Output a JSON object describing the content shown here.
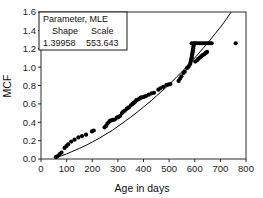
{
  "chart_data": {
    "type": "scatter",
    "title": "",
    "xlabel": "Age in days",
    "ylabel": "MCF",
    "xlim": [
      0,
      800
    ],
    "ylim": [
      0.0,
      1.6
    ],
    "xticks": [
      0,
      100,
      200,
      300,
      400,
      500,
      600,
      700,
      800
    ],
    "xtick_labels": [
      "0",
      "100",
      "200",
      "300",
      "400",
      "500",
      "600",
      "700",
      "800"
    ],
    "yticks": [
      0.0,
      0.2,
      0.4,
      0.6,
      0.8,
      1.0,
      1.2,
      1.4,
      1.6
    ],
    "ytick_labels": [
      "0.0",
      "0.2",
      "0.4",
      "0.6",
      "0.8",
      "1.0",
      "1.2",
      "1.4",
      "1.6"
    ],
    "grid": false,
    "legend_position": "upper-left",
    "marker_color": "#000000",
    "line_color": "#000000",
    "series": [
      {
        "name": "MCF data",
        "type": "scatter",
        "points": [
          [
            58,
            0.02
          ],
          [
            64,
            0.03
          ],
          [
            72,
            0.05
          ],
          [
            80,
            0.07
          ],
          [
            92,
            0.12
          ],
          [
            99,
            0.14
          ],
          [
            106,
            0.16
          ],
          [
            118,
            0.19
          ],
          [
            131,
            0.21
          ],
          [
            146,
            0.235
          ],
          [
            160,
            0.25
          ],
          [
            176,
            0.265
          ],
          [
            199,
            0.3
          ],
          [
            206,
            0.31
          ],
          [
            248,
            0.345
          ],
          [
            254,
            0.36
          ],
          [
            259,
            0.385
          ],
          [
            264,
            0.4
          ],
          [
            269,
            0.415
          ],
          [
            274,
            0.42
          ],
          [
            281,
            0.425
          ],
          [
            288,
            0.43
          ],
          [
            296,
            0.45
          ],
          [
            302,
            0.455
          ],
          [
            309,
            0.47
          ],
          [
            316,
            0.5
          ],
          [
            321,
            0.515
          ],
          [
            327,
            0.525
          ],
          [
            334,
            0.545
          ],
          [
            339,
            0.555
          ],
          [
            345,
            0.565
          ],
          [
            351,
            0.585
          ],
          [
            357,
            0.6
          ],
          [
            362,
            0.61
          ],
          [
            368,
            0.625
          ],
          [
            372,
            0.64
          ],
          [
            377,
            0.645
          ],
          [
            383,
            0.655
          ],
          [
            388,
            0.665
          ],
          [
            393,
            0.67
          ],
          [
            399,
            0.675
          ],
          [
            404,
            0.68
          ],
          [
            410,
            0.685
          ],
          [
            421,
            0.7
          ],
          [
            432,
            0.715
          ],
          [
            441,
            0.72
          ],
          [
            458,
            0.755
          ],
          [
            466,
            0.77
          ],
          [
            477,
            0.785
          ],
          [
            489,
            0.805
          ],
          [
            497,
            0.81
          ],
          [
            505,
            0.815
          ],
          [
            537,
            0.85
          ],
          [
            543,
            0.875
          ],
          [
            548,
            0.9
          ],
          [
            556,
            0.935
          ],
          [
            561,
            0.95
          ],
          [
            570,
            0.99
          ],
          [
            574,
            1.0
          ],
          [
            578,
            1.015
          ],
          [
            582,
            1.035
          ],
          [
            584,
            1.055
          ],
          [
            586,
            1.075
          ],
          [
            587,
            1.09
          ],
          [
            588,
            1.105
          ],
          [
            589,
            1.125
          ],
          [
            590,
            1.14
          ],
          [
            591,
            1.155
          ],
          [
            592,
            1.17
          ],
          [
            593,
            1.19
          ],
          [
            594,
            1.205
          ],
          [
            595,
            1.225
          ],
          [
            596,
            1.245
          ],
          [
            598,
            1.26
          ],
          [
            588,
            1.26
          ],
          [
            597,
            1.26
          ],
          [
            604,
            1.26
          ],
          [
            611,
            1.26
          ],
          [
            618,
            1.26
          ],
          [
            625,
            1.26
          ],
          [
            632,
            1.26
          ],
          [
            639,
            1.26
          ],
          [
            646,
            1.26
          ],
          [
            653,
            1.26
          ],
          [
            660,
            1.26
          ],
          [
            666,
            1.26
          ],
          [
            602,
            1.06
          ],
          [
            609,
            1.075
          ],
          [
            614,
            1.09
          ],
          [
            620,
            1.105
          ],
          [
            626,
            1.12
          ],
          [
            631,
            1.13
          ],
          [
            637,
            1.14
          ],
          [
            643,
            1.155
          ],
          [
            648,
            1.165
          ],
          [
            760,
            1.26
          ]
        ]
      },
      {
        "name": "MLE fitted Weibull curve",
        "type": "line",
        "points": [
          [
            58,
            0.02
          ],
          [
            80,
            0.035
          ],
          [
            100,
            0.055
          ],
          [
            120,
            0.08
          ],
          [
            150,
            0.115
          ],
          [
            180,
            0.155
          ],
          [
            200,
            0.185
          ],
          [
            230,
            0.23
          ],
          [
            250,
            0.265
          ],
          [
            280,
            0.315
          ],
          [
            300,
            0.355
          ],
          [
            330,
            0.415
          ],
          [
            350,
            0.455
          ],
          [
            380,
            0.52
          ],
          [
            400,
            0.565
          ],
          [
            430,
            0.635
          ],
          [
            450,
            0.685
          ],
          [
            480,
            0.76
          ],
          [
            500,
            0.81
          ],
          [
            530,
            0.895
          ],
          [
            550,
            0.95
          ],
          [
            580,
            1.04
          ],
          [
            600,
            1.1
          ],
          [
            620,
            1.165
          ],
          [
            640,
            1.23
          ],
          [
            660,
            1.295
          ],
          [
            680,
            1.365
          ],
          [
            700,
            1.435
          ],
          [
            715,
            1.49
          ],
          [
            725,
            1.53
          ],
          [
            735,
            1.57
          ],
          [
            742,
            1.598
          ]
        ]
      }
    ],
    "annotations": {
      "legend_title": "Parameter, MLE",
      "columns": [
        "Shape",
        "Scale"
      ],
      "values": [
        "1.39958",
        "553.643"
      ]
    }
  }
}
